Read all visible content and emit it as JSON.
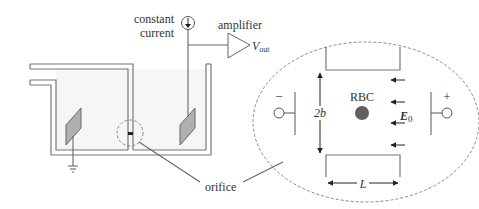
{
  "diagram": {
    "labels": {
      "constant_current_line1": "constant",
      "constant_current_line2": "current",
      "amplifier": "amplifier",
      "vout_main": "V",
      "vout_sub": "out",
      "orifice": "orifice",
      "rbc": "RBC",
      "two_b": "2b",
      "e0_main": "E",
      "e0_sub": "0",
      "length": "L",
      "minus": "−",
      "plus": "+"
    },
    "colors": {
      "line": "#777777",
      "electrode_fill": "#b0b0b0",
      "rbc_fill": "#606060",
      "text": "#333333",
      "fluid": "#f6f6f6"
    },
    "components": [
      "fluid-tank",
      "inlet-pipe",
      "left-electrode-grounded",
      "right-electrode",
      "constant-current-source",
      "amplifier",
      "orifice",
      "magnified-orifice-view"
    ],
    "field_arrows_count": 4
  }
}
